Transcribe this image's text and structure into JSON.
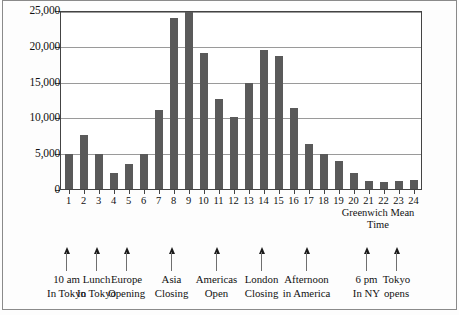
{
  "chart_data": {
    "type": "bar",
    "title": "",
    "xlabel": "Greenwich Mean Time",
    "ylabel": "",
    "ylim": [
      0,
      25000
    ],
    "yticks": [
      0,
      5000,
      10000,
      15000,
      20000,
      25000
    ],
    "ytick_labels": [
      "0",
      "5,000",
      "10,000",
      "15,000",
      "20,000",
      "25,000"
    ],
    "grid": true,
    "legend": "none",
    "categories": [
      "1",
      "2",
      "3",
      "4",
      "5",
      "6",
      "7",
      "8",
      "9",
      "10",
      "11",
      "12",
      "13",
      "14",
      "15",
      "16",
      "17",
      "18",
      "19",
      "20",
      "21",
      "22",
      "23",
      "24"
    ],
    "values": [
      4900,
      7600,
      4900,
      2200,
      3500,
      4900,
      11100,
      24100,
      25000,
      19200,
      12700,
      10200,
      15000,
      19700,
      18800,
      11400,
      6400,
      4900,
      3900,
      2200,
      1200,
      1000,
      1200,
      1300
    ],
    "bar_color": "#5a5a5a",
    "annotations": [
      {
        "category": "1",
        "text": "10 am\nIn Tokyo"
      },
      {
        "category": "3",
        "text": "Lunch\nIn Tokyo"
      },
      {
        "category": "5",
        "text": "Europe\nOpening"
      },
      {
        "category": "8",
        "text": "Asia\nClosing"
      },
      {
        "category": "11",
        "text": "Americas\nOpen"
      },
      {
        "category": "14",
        "text": "London\nClosing"
      },
      {
        "category": "17",
        "text": "Afternoon\nin America"
      },
      {
        "category": "21",
        "text": "6 pm\nIn NY"
      },
      {
        "category": "23",
        "text": "Tokyo\nopens"
      }
    ]
  },
  "axis": {
    "x_caption_line1": "Greenwich Mean",
    "x_caption_line2": "Time"
  }
}
